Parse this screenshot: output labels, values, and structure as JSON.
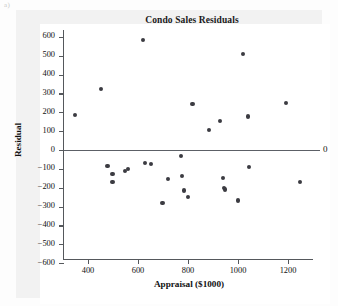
{
  "figure": {
    "corner_mark": "a)",
    "background_color": "#f2f2f2",
    "point_color": "#3b3b42",
    "axis_color": "#55585c",
    "zero_line_label": "0"
  },
  "chart_data": {
    "type": "scatter",
    "title": "Condo Sales Residuals",
    "xlabel": "Appraisal ($1000)",
    "ylabel": "Residual",
    "xlim": [
      300,
      1260
    ],
    "ylim": [
      -600,
      600
    ],
    "xticks": [
      400,
      600,
      800,
      1000,
      1200
    ],
    "yticks": [
      600,
      500,
      400,
      300,
      200,
      100,
      0,
      -100,
      -200,
      -300,
      -400,
      -500,
      -600
    ],
    "xtick_labels": [
      "400",
      "600",
      "800",
      "1000",
      "1200"
    ],
    "ytick_labels": [
      "600",
      "500",
      "400",
      "300",
      "200",
      "100",
      "0",
      "−100",
      "−200",
      "−300",
      "−400",
      "−500",
      "−600"
    ],
    "grid": false,
    "legend": false,
    "reference_line": {
      "y": 0,
      "label": "0"
    },
    "points": [
      {
        "x": 348,
        "y": 185
      },
      {
        "x": 452,
        "y": 325
      },
      {
        "x": 620,
        "y": 585
      },
      {
        "x": 478,
        "y": -85
      },
      {
        "x": 498,
        "y": -128
      },
      {
        "x": 498,
        "y": -168
      },
      {
        "x": 548,
        "y": -110
      },
      {
        "x": 560,
        "y": -100
      },
      {
        "x": 628,
        "y": -68
      },
      {
        "x": 652,
        "y": -75
      },
      {
        "x": 698,
        "y": -283
      },
      {
        "x": 720,
        "y": -152
      },
      {
        "x": 772,
        "y": -30
      },
      {
        "x": 776,
        "y": -138
      },
      {
        "x": 784,
        "y": -215
      },
      {
        "x": 800,
        "y": -248
      },
      {
        "x": 818,
        "y": 243
      },
      {
        "x": 884,
        "y": 105
      },
      {
        "x": 928,
        "y": 155
      },
      {
        "x": 940,
        "y": -148
      },
      {
        "x": 944,
        "y": -200
      },
      {
        "x": 948,
        "y": -210
      },
      {
        "x": 1000,
        "y": -268
      },
      {
        "x": 1020,
        "y": 510
      },
      {
        "x": 1040,
        "y": 178
      },
      {
        "x": 1044,
        "y": -90
      },
      {
        "x": 1192,
        "y": 250
      },
      {
        "x": 1248,
        "y": -170
      }
    ]
  }
}
